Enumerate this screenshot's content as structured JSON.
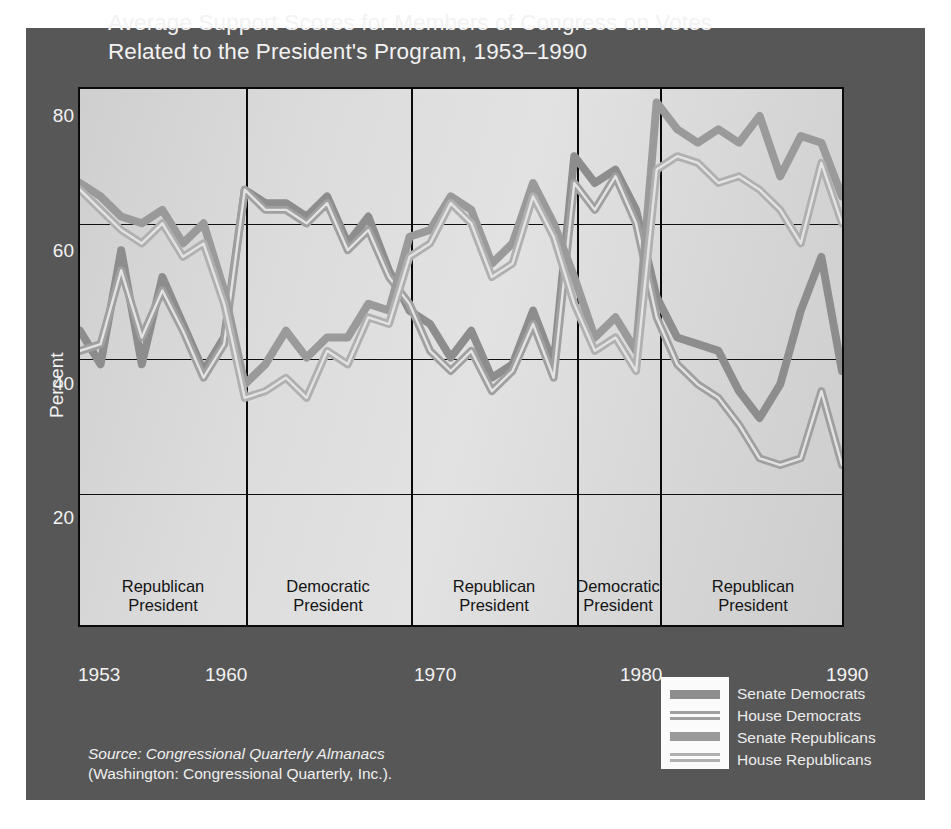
{
  "title": {
    "line1": "Average Support Scores for Members of Congress on Votes",
    "line2": "Related to the President's Program, 1953–1990"
  },
  "source": {
    "label": "Source",
    "line1_italic": ": Congressional Quarterly Almanacs",
    "line2": "(Washington: Congressional Quarterly, Inc.)."
  },
  "colors": {
    "panel_bg": "#575757",
    "plot_bg": "#d8d8d8",
    "axis": "#0a0a0a",
    "text_light": "#f2f2f2",
    "text_dark": "#141414",
    "senate_democrats": "#8d8d8d",
    "house_democrats": "#a0a0a0",
    "senate_republicans": "#9a9a9a",
    "house_republicans": "#b0b0b0"
  },
  "legend": {
    "position": "bottom-right",
    "items": [
      {
        "label": "Senate Democrats",
        "style": "solid",
        "color": "#8d8d8d"
      },
      {
        "label": "House Democrats",
        "style": "double",
        "color": "#a0a0a0"
      },
      {
        "label": "Senate Republicans",
        "style": "solid",
        "color": "#9a9a9a"
      },
      {
        "label": "House Republicans",
        "style": "double",
        "color": "#b0b0b0"
      }
    ]
  },
  "periods": [
    {
      "label_line1": "Republican",
      "label_line2": "President",
      "start": 1953,
      "end": 1961
    },
    {
      "label_line1": "Democratic",
      "label_line2": "President",
      "start": 1961,
      "end": 1969
    },
    {
      "label_line1": "Republican",
      "label_line2": "President",
      "start": 1969,
      "end": 1977
    },
    {
      "label_line1": "Democratic",
      "label_line2": "President",
      "start": 1977,
      "end": 1981
    },
    {
      "label_line1": "Republican",
      "label_line2": "President",
      "start": 1981,
      "end": 1990
    }
  ],
  "chart_data": {
    "type": "line",
    "title": "Average Support Scores for Members of Congress on Votes Related to the President's Program, 1953–1990",
    "xlabel": "",
    "ylabel": "Percent",
    "xlim": [
      1953,
      1990
    ],
    "ylim": [
      0,
      80
    ],
    "yticks": [
      20,
      40,
      60,
      80
    ],
    "xticks": [
      1953,
      1960,
      1970,
      1980,
      1990
    ],
    "grid": "horizontal-at-20-40-60",
    "period_dividers": [
      1961,
      1969,
      1977,
      1981
    ],
    "x": [
      1953,
      1954,
      1955,
      1956,
      1957,
      1958,
      1959,
      1960,
      1961,
      1962,
      1963,
      1964,
      1965,
      1966,
      1967,
      1968,
      1969,
      1970,
      1971,
      1972,
      1973,
      1974,
      1975,
      1976,
      1977,
      1978,
      1979,
      1980,
      1981,
      1982,
      1983,
      1984,
      1985,
      1986,
      1987,
      1988,
      1989,
      1990
    ],
    "series": [
      {
        "name": "Senate Democrats",
        "style": "solid",
        "color": "#8d8d8d",
        "values": [
          44,
          39,
          56,
          39,
          52,
          45,
          38,
          43,
          65,
          63,
          63,
          61,
          64,
          57,
          61,
          53,
          47,
          45,
          40,
          44,
          37,
          39,
          47,
          39,
          70,
          66,
          68,
          62,
          49,
          43,
          42,
          41,
          35,
          31,
          36,
          47,
          55,
          38
        ]
      },
      {
        "name": "House Democrats",
        "style": "double",
        "color": "#a0a0a0",
        "values": [
          41,
          42,
          53,
          43,
          50,
          44,
          37,
          42,
          65,
          62,
          62,
          60,
          63,
          56,
          59,
          52,
          48,
          41,
          38,
          41,
          35,
          38,
          45,
          37,
          66,
          62,
          67,
          60,
          46,
          39,
          36,
          34,
          30,
          25,
          24,
          25,
          35,
          24
        ]
      },
      {
        "name": "Senate Republicans",
        "style": "solid",
        "color": "#9a9a9a",
        "values": [
          66,
          64,
          61,
          60,
          62,
          57,
          60,
          50,
          36,
          39,
          44,
          40,
          43,
          43,
          48,
          47,
          58,
          59,
          64,
          62,
          54,
          57,
          66,
          60,
          52,
          43,
          46,
          41,
          78,
          74,
          72,
          74,
          72,
          76,
          67,
          73,
          72,
          64
        ]
      },
      {
        "name": "House Republicans",
        "style": "double",
        "color": "#b0b0b0",
        "values": [
          65,
          62,
          59,
          57,
          60,
          55,
          57,
          48,
          34,
          35,
          37,
          34,
          41,
          39,
          46,
          45,
          55,
          57,
          63,
          60,
          52,
          54,
          64,
          58,
          48,
          41,
          43,
          38,
          68,
          70,
          69,
          66,
          67,
          65,
          62,
          57,
          69,
          60
        ]
      }
    ]
  }
}
